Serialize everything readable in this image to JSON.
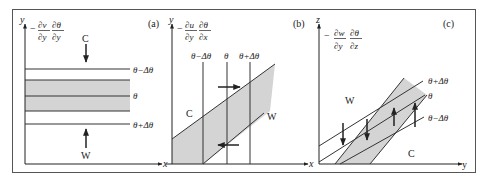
{
  "figure": {
    "panels": [
      {
        "id": "a",
        "tag": "(a)",
        "y_axis_label": "y",
        "x_axis_label": "x",
        "term_prefix": "−",
        "term_num1": "∂v",
        "term_den1": "∂y",
        "term_num2": "∂θ",
        "term_den2": "∂y",
        "top_arrow_label": "C",
        "bottom_arrow_label": "W",
        "isentropes": [
          "θ−Δθ",
          "θ",
          "θ+Δθ"
        ]
      },
      {
        "id": "b",
        "tag": "(b)",
        "y_axis_label": "y",
        "x_axis_label": "x",
        "term_prefix": "−",
        "term_num1": "∂u",
        "term_den1": "∂y",
        "term_num2": "∂θ",
        "term_den2": "∂x",
        "cold_label": "C",
        "warm_label": "W",
        "isentropes": [
          "θ−Δθ",
          "θ",
          "θ+Δθ"
        ]
      },
      {
        "id": "c",
        "tag": "(c)",
        "y_axis_label": "z",
        "x_axis_label": "y",
        "term_prefix": "−",
        "term_num1": "∂w",
        "term_den1": "∂y",
        "term_num2": "∂θ",
        "term_den2": "∂z",
        "warm_label": "W",
        "cold_label": "C",
        "isentropes": [
          "θ+Δθ",
          "θ",
          "θ−Δθ"
        ]
      }
    ],
    "colors": {
      "line": "#333333",
      "shade": "#d4d4d4",
      "frame": "#555555"
    }
  }
}
